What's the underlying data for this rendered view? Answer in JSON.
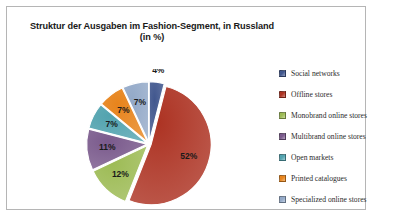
{
  "chart_data": {
    "type": "pie",
    "title": "Struktur der Ausgaben im Fashion-Segment, in Russland",
    "subtitle": "(in %)",
    "xlabel": "",
    "ylabel": "",
    "unit": "%",
    "legend_position": "right",
    "grid": false,
    "categories": [
      "Social networks",
      "Offline stores",
      "Monobrand online stores",
      "Multibrand online stores",
      "Open markets",
      "Printed catalogues",
      "Specialized online stores"
    ],
    "values": [
      4,
      52,
      12,
      11,
      7,
      7,
      7
    ],
    "data_labels": [
      "4%",
      "52%",
      "12%",
      "11%",
      "7%",
      "7%",
      "7%"
    ],
    "colors": [
      "#41578E",
      "#AD3323",
      "#9DBB55",
      "#7A5A8C",
      "#52A3AF",
      "#E7841C",
      "#93A9C8"
    ],
    "slices": [
      {
        "label": "Social networks",
        "value": 4,
        "data_label": "4%",
        "color": "#41578E"
      },
      {
        "label": "Offline stores",
        "value": 52,
        "data_label": "52%",
        "color": "#AD3323"
      },
      {
        "label": "Monobrand online stores",
        "value": 12,
        "data_label": "12%",
        "color": "#9DBB55"
      },
      {
        "label": "Multibrand online stores",
        "value": 11,
        "data_label": "11%",
        "color": "#7A5A8C"
      },
      {
        "label": "Open markets",
        "value": 7,
        "data_label": "7%",
        "color": "#52A3AF"
      },
      {
        "label": "Printed catalogues",
        "value": 7,
        "data_label": "7%",
        "color": "#E7841C"
      },
      {
        "label": "Specialized online stores",
        "value": 7,
        "data_label": "7%",
        "color": "#93A9C8"
      }
    ]
  },
  "legend": {
    "items": [
      {
        "label": "Social networks",
        "color": "#41578E"
      },
      {
        "label": "Offline stores",
        "color": "#AD3323"
      },
      {
        "label": "Monobrand online stores",
        "color": "#9DBB55"
      },
      {
        "label": "Multibrand online stores",
        "color": "#7A5A8C"
      },
      {
        "label": "Open markets",
        "color": "#52A3AF"
      },
      {
        "label": "Printed catalogues",
        "color": "#E7841C"
      },
      {
        "label": "Specialized online stores",
        "color": "#93A9C8"
      }
    ]
  },
  "frame": {
    "border_color": "#b5b5b5",
    "background": "#ffffff"
  }
}
